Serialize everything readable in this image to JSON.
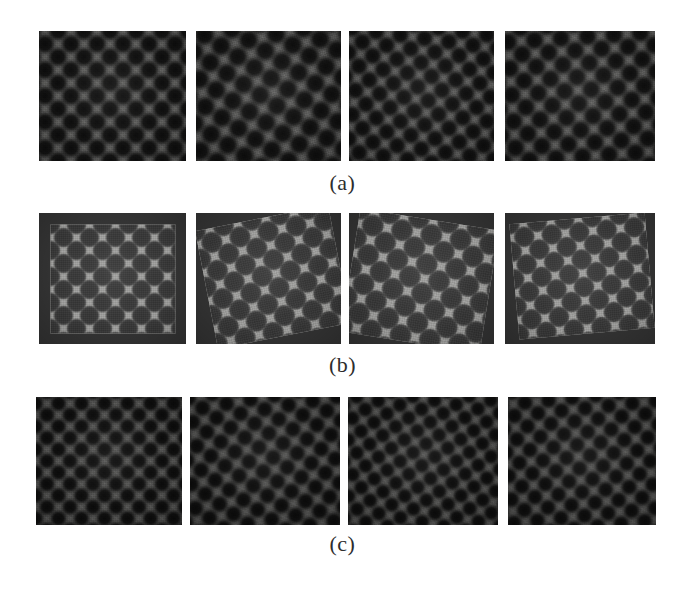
{
  "figure": {
    "background_color": "#ffffff",
    "width": 685,
    "height": 590
  },
  "rows": [
    {
      "id": "row-a",
      "label": "(a)",
      "label_center_x": 340,
      "label_y": 170,
      "texture_style": "dark-blob-lattice",
      "base_color": "#30302f",
      "blob_color": "#000000",
      "highlight_color": "#96968f",
      "panels": [
        {
          "index": 1,
          "x": 39,
          "y": 31,
          "w": 147,
          "h": 130,
          "rotation": 0,
          "scale": 1.0,
          "offset_x": 0,
          "offset_y": 0
        },
        {
          "index": 2,
          "x": 196,
          "y": 31,
          "w": 145,
          "h": 130,
          "rotation": -12,
          "scale": 1.08,
          "offset_x": 6,
          "offset_y": -4
        },
        {
          "index": 3,
          "x": 349,
          "y": 31,
          "w": 145,
          "h": 130,
          "rotation": 8,
          "scale": 0.94,
          "offset_x": -5,
          "offset_y": 3
        },
        {
          "index": 4,
          "x": 505,
          "y": 31,
          "w": 150,
          "h": 130,
          "rotation": -4,
          "scale": 1.02,
          "offset_x": 3,
          "offset_y": -6
        }
      ]
    },
    {
      "id": "row-b",
      "label": "(b)",
      "label_center_x": 340,
      "label_y": 352,
      "texture_style": "bright-checkerboard",
      "base_color": "#9a9a98",
      "square_dark_color": "#3a3a3a",
      "frame_color": "#333333",
      "panels": [
        {
          "index": 1,
          "x": 39,
          "y": 213,
          "w": 147,
          "h": 131,
          "rotation": 0,
          "scale": 1.0,
          "offset_x": 0,
          "offset_y": 0
        },
        {
          "index": 2,
          "x": 196,
          "y": 213,
          "w": 145,
          "h": 131,
          "rotation": -11,
          "scale": 1.1,
          "offset_x": 4,
          "offset_y": -2
        },
        {
          "index": 3,
          "x": 349,
          "y": 213,
          "w": 145,
          "h": 131,
          "rotation": 9,
          "scale": 1.14,
          "offset_x": -2,
          "offset_y": 2
        },
        {
          "index": 4,
          "x": 505,
          "y": 213,
          "w": 150,
          "h": 131,
          "rotation": -5,
          "scale": 1.06,
          "offset_x": 2,
          "offset_y": -3
        }
      ]
    },
    {
      "id": "row-c",
      "label": "(c)",
      "label_center_x": 340,
      "label_y": 531,
      "texture_style": "dark-fine-lattice",
      "base_color": "#2b2b2a",
      "blob_color": "#000000",
      "highlight_color": "#8c8c88",
      "panels": [
        {
          "index": 1,
          "x": 36,
          "y": 397,
          "w": 146,
          "h": 128,
          "rotation": 0,
          "scale": 1.0,
          "offset_x": 0,
          "offset_y": 0
        },
        {
          "index": 2,
          "x": 190,
          "y": 397,
          "w": 150,
          "h": 128,
          "rotation": -10,
          "scale": 1.06,
          "offset_x": 5,
          "offset_y": -3
        },
        {
          "index": 3,
          "x": 348,
          "y": 397,
          "w": 150,
          "h": 128,
          "rotation": 11,
          "scale": 0.96,
          "offset_x": -4,
          "offset_y": 4
        },
        {
          "index": 4,
          "x": 508,
          "y": 397,
          "w": 148,
          "h": 128,
          "rotation": -6,
          "scale": 1.03,
          "offset_x": 3,
          "offset_y": -5
        }
      ]
    }
  ]
}
